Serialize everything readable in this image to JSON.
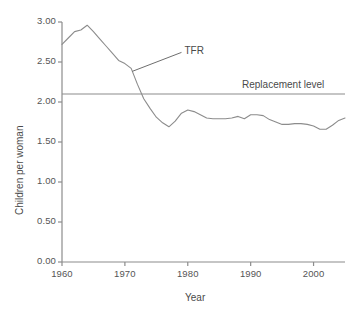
{
  "chart_data": {
    "type": "line",
    "title": "",
    "xlabel": "Year",
    "ylabel": "Children per woman",
    "xlim": [
      1960,
      2005
    ],
    "ylim": [
      0.0,
      3.0
    ],
    "grid": false,
    "legend_position": "none",
    "x_ticks": [
      "1960",
      "1970",
      "1980",
      "1990",
      "2000"
    ],
    "x_tick_values": [
      1960,
      1970,
      1980,
      1990,
      2000
    ],
    "y_ticks": [
      "0.00",
      "0.50",
      "1.00",
      "1.50",
      "2.00",
      "2.50",
      "3.00"
    ],
    "y_tick_values": [
      0.0,
      0.5,
      1.0,
      1.5,
      2.0,
      2.5,
      3.0
    ],
    "x": [
      1960,
      1961,
      1962,
      1963,
      1964,
      1965,
      1966,
      1967,
      1968,
      1969,
      1970,
      1971,
      1972,
      1973,
      1974,
      1975,
      1976,
      1977,
      1978,
      1979,
      1980,
      1981,
      1982,
      1983,
      1984,
      1985,
      1986,
      1987,
      1988,
      1989,
      1990,
      1991,
      1992,
      1993,
      1994,
      1995,
      1996,
      1997,
      1998,
      1999,
      2000,
      2001,
      2002,
      2003,
      2004,
      2005
    ],
    "series": [
      {
        "name": "TFR",
        "color": "#8c8c8c",
        "values": [
          2.72,
          2.8,
          2.88,
          2.9,
          2.96,
          2.88,
          2.79,
          2.7,
          2.61,
          2.52,
          2.48,
          2.42,
          2.22,
          2.04,
          1.92,
          1.81,
          1.74,
          1.69,
          1.76,
          1.86,
          1.9,
          1.88,
          1.84,
          1.8,
          1.79,
          1.79,
          1.79,
          1.8,
          1.82,
          1.79,
          1.84,
          1.84,
          1.83,
          1.78,
          1.75,
          1.72,
          1.72,
          1.73,
          1.73,
          1.72,
          1.7,
          1.66,
          1.66,
          1.71,
          1.77,
          1.8
        ]
      },
      {
        "name": "Replacement level",
        "color": "#8c8c8c",
        "constant": 2.1
      }
    ],
    "annotations": [
      {
        "text": "TFR",
        "x": 1971,
        "y": 2.42,
        "label_x": 1979,
        "label_y": 2.62
      },
      {
        "text": "Replacement level",
        "x": 2005,
        "y": 2.1
      }
    ]
  },
  "axes": {
    "y_title": "Children per woman",
    "x_title": "Year"
  },
  "colors": {
    "line": "#8c8c8c",
    "axis": "#8c8c8c",
    "text": "#4a4a4a",
    "background": "#ffffff"
  }
}
